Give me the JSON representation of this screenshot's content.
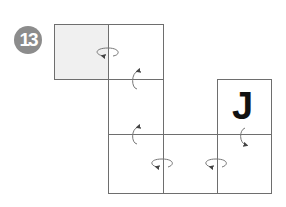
{
  "figure": {
    "step_number": "13",
    "badge_color": "#8c8c8c",
    "grid_line_color": "#6e6e6e",
    "shaded_color": "#f0f0f0",
    "cells": [
      {
        "id": "c1",
        "row": 0,
        "col": 0,
        "shaded": true,
        "letter": ""
      },
      {
        "id": "c2",
        "row": 0,
        "col": 1,
        "shaded": false,
        "letter": ""
      },
      {
        "id": "c3",
        "row": 1,
        "col": 1,
        "shaded": false,
        "letter": ""
      },
      {
        "id": "c4",
        "row": 1,
        "col": 3,
        "shaded": false,
        "letter": "J"
      },
      {
        "id": "c5",
        "row": 2,
        "col": 1,
        "shaded": false,
        "letter": ""
      },
      {
        "id": "c6",
        "row": 2,
        "col": 2,
        "shaded": false,
        "letter": ""
      },
      {
        "id": "c7",
        "row": 2,
        "col": 3,
        "shaded": false,
        "letter": ""
      }
    ],
    "fold_arrows": [
      {
        "between": [
          "c1",
          "c2"
        ],
        "type": "horizontal-rotation"
      },
      {
        "between": [
          "c2",
          "c3"
        ],
        "type": "vertical-rotation"
      },
      {
        "between": [
          "c3",
          "c5"
        ],
        "type": "vertical-rotation"
      },
      {
        "between": [
          "c5",
          "c6"
        ],
        "type": "horizontal-rotation"
      },
      {
        "between": [
          "c6",
          "c7"
        ],
        "type": "horizontal-rotation"
      },
      {
        "between": [
          "c4",
          "c7"
        ],
        "type": "vertical-rotation"
      }
    ],
    "letter_J": "J"
  }
}
